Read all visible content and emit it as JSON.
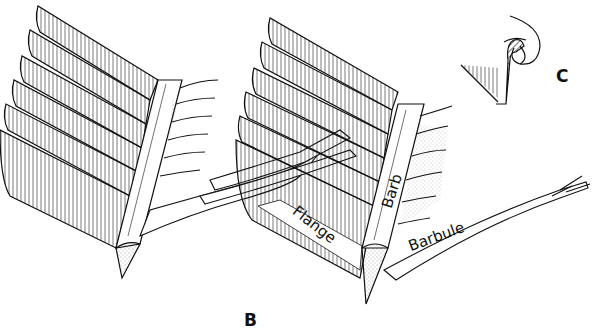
{
  "figure": {
    "colors": {
      "ink": "#111111",
      "background": "#ffffff"
    },
    "panels": [
      {
        "id": "B",
        "letter": "B"
      },
      {
        "id": "C",
        "letter": "C"
      }
    ],
    "labels": {
      "flange": "Flange",
      "barb": "Barb",
      "barbule": "Barbule"
    }
  }
}
